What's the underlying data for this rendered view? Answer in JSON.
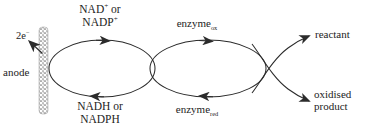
{
  "figure": {
    "kind": "enzymatic-electron-transfer-cycle-diagram",
    "background_color": "#ffffff",
    "stroke_color": "#2b2b2b",
    "text_color": "#232323"
  },
  "electrode": {
    "label": "anode",
    "electron_label_prefix": "2e",
    "electron_label_charge": "−",
    "pattern": "stippled-dotted-column"
  },
  "cofactor_cycle": {
    "top_line1": "NAD",
    "top_charge1": "+",
    "top_or": " or",
    "top_line2": "NADP",
    "top_charge2": "+",
    "bottom_line1": "NADH or",
    "bottom_line2": "NADPH",
    "top_arrow_direction": "right",
    "bottom_arrow_direction": "left"
  },
  "enzyme_cycle": {
    "top_base": "enzyme",
    "top_sub": "ox",
    "bottom_base": "enzyme",
    "bottom_sub": "red",
    "top_arrow_direction": "right",
    "bottom_arrow_direction": "left"
  },
  "substrate_branch": {
    "top_label": "reactant",
    "bottom_label_line1": "oxidised",
    "bottom_label_line2": "product",
    "top_arrow_direction": "up-right",
    "bottom_arrow_direction": "down-right"
  }
}
